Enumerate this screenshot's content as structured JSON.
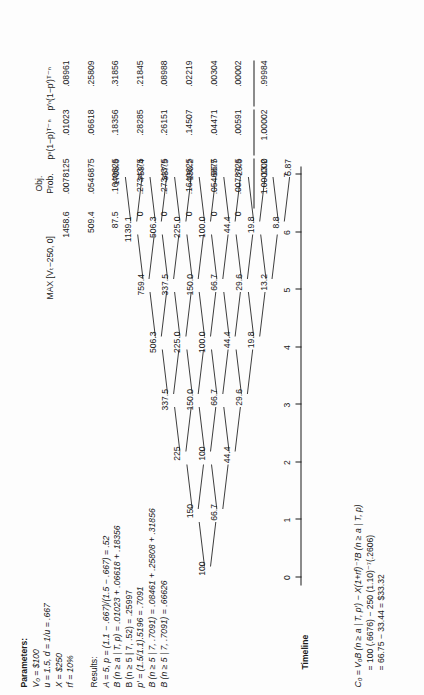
{
  "figure": {
    "parameters": {
      "heading": "Parameters:",
      "lines": [
        "V₀ = $100",
        "u  = 1.5, d = 1/u = .667",
        "X  = $250",
        "rf = 10%"
      ]
    },
    "results": {
      "heading": "Results:",
      "lines": [
        "A = 5, p = (1.1 − .667)/(1.5 − .667) = .52",
        "B (n ≥ a | T, p) = .01023 + .06618 + .18356",
        "B (n ≥ 5 | 7, .52) = .25997",
        "p′ = (1.5/1.1).5196 = .7091",
        "B (n ≥ 5 | 7, .7091) = .08461 + .25808 + .31856",
        "B (n ≥ 5 | 7, .7091) = .66626"
      ]
    },
    "valuation": {
      "lines": [
        "C₀ = V₀B (n ≥ a | T, p′) − X(1+rf)⁻ᵀB (n ≥ a | T, p)",
        "= 100 (.6676) − 250 (1.10)⁻⁷(.2606)",
        "= 66.75 − 33.44 = $33.32"
      ]
    },
    "timeline": {
      "label": "Timeline",
      "ticks": [
        "0",
        "1",
        "2",
        "3",
        "4",
        "5",
        "6",
        "7"
      ]
    },
    "table": {
      "headers": {
        "payoff": "MAX [Vₜ−250, 0]",
        "obj_prob": "Obj.\nProb.",
        "obj_prob_line1": "Obj.",
        "obj_prob_line2": "Prob.",
        "col3": "pⁿ(1−p)ᵀ⁻ⁿ",
        "col4": "p′ⁿ(1−p′)ᵀ⁻ⁿ"
      },
      "rows": [
        {
          "payoff": "1458.6",
          "obj_prob": ".0078125",
          "col3": ".01023",
          "col4": ".08961"
        },
        {
          "payoff": "509.4",
          "obj_prob": ".0546875",
          "col3": ".06618",
          "col4": ".25809"
        },
        {
          "payoff": "87.5",
          "obj_prob": ".1640625",
          "col3": ".18356",
          "col4": ".31856"
        },
        {
          "payoff": "0",
          "obj_prob": ".2734375",
          "col3": ".28285",
          "col4": ".21845"
        },
        {
          "payoff": "0",
          "obj_prob": ".2734375",
          "col3": ".26151",
          "col4": ".08988"
        },
        {
          "payoff": "0",
          "obj_prob": ".1640625",
          "col3": ".14507",
          "col4": ".02219"
        },
        {
          "payoff": "0",
          "obj_prob": ".0546875",
          "col3": ".04471",
          "col4": ".00304"
        },
        {
          "payoff": "0",
          "obj_prob": ".0078725",
          "col3": ".00591",
          "col4": ".00002"
        }
      ],
      "totals": {
        "payoff": "",
        "obj_prob": "1.000000",
        "col3": "1.00002",
        "col4": ".99984"
      }
    },
    "tree": {
      "columns": [
        {
          "t": 0,
          "values": [
            "100"
          ]
        },
        {
          "t": 1,
          "values": [
            "150",
            "66.7"
          ]
        },
        {
          "t": 2,
          "values": [
            "225",
            "100",
            "44.4"
          ]
        },
        {
          "t": 3,
          "values": [
            "337.5",
            "150.0",
            "66.7",
            "29.6"
          ]
        },
        {
          "t": 4,
          "values": [
            "506.3",
            "225.0",
            "100.0",
            "44.4",
            "19.8"
          ]
        },
        {
          "t": 5,
          "values": [
            "759.4",
            "337.5",
            "150.0",
            "66.7",
            "29.6",
            "13.2"
          ]
        },
        {
          "t": 6,
          "values": [
            "1139.1",
            "506.3",
            "225.0",
            "100.0",
            "44.4",
            "19.8",
            "8.8"
          ]
        },
        {
          "t": 7,
          "values": [
            "1708.6",
            "759.4",
            "337.5",
            "150.2",
            "66.7",
            "29.6",
            "13.2",
            "5.87"
          ]
        }
      ]
    }
  }
}
